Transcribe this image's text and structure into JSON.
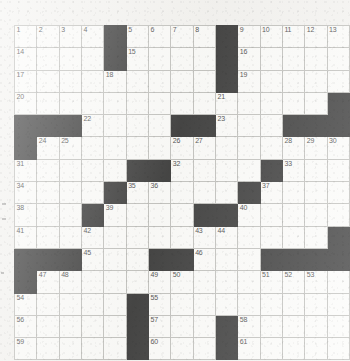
{
  "puzzle": {
    "title": "Crossword Grid",
    "rows": 15,
    "cols": 15,
    "cell_size_px": 21.5,
    "colors": {
      "paper": "#f2f1ee",
      "cell_fill": "#fbfbf9",
      "block_fill": "#0d0d0d",
      "grid_line": "#b3b3af",
      "number_text": "#1a1a1a"
    },
    "highest_clue_number": 61,
    "black_square_count": 54,
    "grid": [
      [
        {
          "block": false,
          "num": "1"
        },
        {
          "block": false,
          "num": "2"
        },
        {
          "block": false,
          "num": "3"
        },
        {
          "block": false,
          "num": "4"
        },
        {
          "block": true,
          "num": ""
        },
        {
          "block": false,
          "num": "5"
        },
        {
          "block": false,
          "num": "6"
        },
        {
          "block": false,
          "num": "7"
        },
        {
          "block": false,
          "num": "8"
        },
        {
          "block": true,
          "num": ""
        },
        {
          "block": false,
          "num": "9"
        },
        {
          "block": false,
          "num": "10"
        },
        {
          "block": false,
          "num": "11"
        },
        {
          "block": false,
          "num": "12"
        },
        {
          "block": false,
          "num": "13"
        }
      ],
      [
        {
          "block": false,
          "num": "14"
        },
        {
          "block": false,
          "num": ""
        },
        {
          "block": false,
          "num": ""
        },
        {
          "block": false,
          "num": ""
        },
        {
          "block": true,
          "num": ""
        },
        {
          "block": false,
          "num": "15"
        },
        {
          "block": false,
          "num": ""
        },
        {
          "block": false,
          "num": ""
        },
        {
          "block": false,
          "num": ""
        },
        {
          "block": true,
          "num": ""
        },
        {
          "block": false,
          "num": "16"
        },
        {
          "block": false,
          "num": ""
        },
        {
          "block": false,
          "num": ""
        },
        {
          "block": false,
          "num": ""
        },
        {
          "block": false,
          "num": ""
        }
      ],
      [
        {
          "block": false,
          "num": "17"
        },
        {
          "block": false,
          "num": ""
        },
        {
          "block": false,
          "num": ""
        },
        {
          "block": false,
          "num": ""
        },
        {
          "block": false,
          "num": "18"
        },
        {
          "block": false,
          "num": ""
        },
        {
          "block": false,
          "num": ""
        },
        {
          "block": false,
          "num": ""
        },
        {
          "block": false,
          "num": ""
        },
        {
          "block": true,
          "num": ""
        },
        {
          "block": false,
          "num": "19"
        },
        {
          "block": false,
          "num": ""
        },
        {
          "block": false,
          "num": ""
        },
        {
          "block": false,
          "num": ""
        },
        {
          "block": false,
          "num": ""
        }
      ],
      [
        {
          "block": false,
          "num": "20"
        },
        {
          "block": false,
          "num": ""
        },
        {
          "block": false,
          "num": ""
        },
        {
          "block": false,
          "num": ""
        },
        {
          "block": false,
          "num": ""
        },
        {
          "block": false,
          "num": ""
        },
        {
          "block": false,
          "num": ""
        },
        {
          "block": false,
          "num": ""
        },
        {
          "block": false,
          "num": ""
        },
        {
          "block": false,
          "num": "21"
        },
        {
          "block": false,
          "num": ""
        },
        {
          "block": false,
          "num": ""
        },
        {
          "block": false,
          "num": ""
        },
        {
          "block": false,
          "num": ""
        },
        {
          "block": true,
          "num": ""
        }
      ],
      [
        {
          "block": true,
          "num": ""
        },
        {
          "block": true,
          "num": ""
        },
        {
          "block": true,
          "num": ""
        },
        {
          "block": false,
          "num": "22"
        },
        {
          "block": false,
          "num": ""
        },
        {
          "block": false,
          "num": ""
        },
        {
          "block": false,
          "num": ""
        },
        {
          "block": true,
          "num": ""
        },
        {
          "block": true,
          "num": ""
        },
        {
          "block": false,
          "num": "23"
        },
        {
          "block": false,
          "num": ""
        },
        {
          "block": false,
          "num": ""
        },
        {
          "block": true,
          "num": ""
        },
        {
          "block": true,
          "num": ""
        },
        {
          "block": true,
          "num": ""
        }
      ],
      [
        {
          "block": true,
          "num": ""
        },
        {
          "block": false,
          "num": "24"
        },
        {
          "block": false,
          "num": "25"
        },
        {
          "block": false,
          "num": ""
        },
        {
          "block": false,
          "num": ""
        },
        {
          "block": false,
          "num": ""
        },
        {
          "block": false,
          "num": ""
        },
        {
          "block": false,
          "num": "26"
        },
        {
          "block": false,
          "num": "27"
        },
        {
          "block": false,
          "num": ""
        },
        {
          "block": false,
          "num": ""
        },
        {
          "block": false,
          "num": ""
        },
        {
          "block": false,
          "num": "28"
        },
        {
          "block": false,
          "num": "29"
        },
        {
          "block": false,
          "num": "30"
        }
      ],
      [
        {
          "block": false,
          "num": "31"
        },
        {
          "block": false,
          "num": ""
        },
        {
          "block": false,
          "num": ""
        },
        {
          "block": false,
          "num": ""
        },
        {
          "block": false,
          "num": ""
        },
        {
          "block": true,
          "num": ""
        },
        {
          "block": true,
          "num": ""
        },
        {
          "block": false,
          "num": "32"
        },
        {
          "block": false,
          "num": ""
        },
        {
          "block": false,
          "num": ""
        },
        {
          "block": false,
          "num": ""
        },
        {
          "block": true,
          "num": ""
        },
        {
          "block": false,
          "num": "33"
        },
        {
          "block": false,
          "num": ""
        },
        {
          "block": false,
          "num": ""
        }
      ],
      [
        {
          "block": false,
          "num": "34"
        },
        {
          "block": false,
          "num": ""
        },
        {
          "block": false,
          "num": ""
        },
        {
          "block": false,
          "num": ""
        },
        {
          "block": true,
          "num": ""
        },
        {
          "block": false,
          "num": "35"
        },
        {
          "block": false,
          "num": "36"
        },
        {
          "block": false,
          "num": ""
        },
        {
          "block": false,
          "num": ""
        },
        {
          "block": false,
          "num": ""
        },
        {
          "block": true,
          "num": ""
        },
        {
          "block": false,
          "num": "37"
        },
        {
          "block": false,
          "num": ""
        },
        {
          "block": false,
          "num": ""
        },
        {
          "block": false,
          "num": ""
        }
      ],
      [
        {
          "block": false,
          "num": "38"
        },
        {
          "block": false,
          "num": ""
        },
        {
          "block": false,
          "num": ""
        },
        {
          "block": true,
          "num": ""
        },
        {
          "block": false,
          "num": "39"
        },
        {
          "block": false,
          "num": ""
        },
        {
          "block": false,
          "num": ""
        },
        {
          "block": false,
          "num": ""
        },
        {
          "block": true,
          "num": ""
        },
        {
          "block": true,
          "num": ""
        },
        {
          "block": false,
          "num": "40"
        },
        {
          "block": false,
          "num": ""
        },
        {
          "block": false,
          "num": ""
        },
        {
          "block": false,
          "num": ""
        },
        {
          "block": false,
          "num": ""
        }
      ],
      [
        {
          "block": false,
          "num": "41"
        },
        {
          "block": false,
          "num": ""
        },
        {
          "block": false,
          "num": ""
        },
        {
          "block": false,
          "num": "42"
        },
        {
          "block": false,
          "num": ""
        },
        {
          "block": false,
          "num": ""
        },
        {
          "block": false,
          "num": ""
        },
        {
          "block": false,
          "num": ""
        },
        {
          "block": false,
          "num": "43"
        },
        {
          "block": false,
          "num": "44"
        },
        {
          "block": false,
          "num": ""
        },
        {
          "block": false,
          "num": ""
        },
        {
          "block": false,
          "num": ""
        },
        {
          "block": false,
          "num": ""
        },
        {
          "block": true,
          "num": ""
        }
      ],
      [
        {
          "block": true,
          "num": ""
        },
        {
          "block": true,
          "num": ""
        },
        {
          "block": true,
          "num": ""
        },
        {
          "block": false,
          "num": "45"
        },
        {
          "block": false,
          "num": ""
        },
        {
          "block": false,
          "num": ""
        },
        {
          "block": true,
          "num": ""
        },
        {
          "block": true,
          "num": ""
        },
        {
          "block": false,
          "num": "46"
        },
        {
          "block": false,
          "num": ""
        },
        {
          "block": false,
          "num": ""
        },
        {
          "block": true,
          "num": ""
        },
        {
          "block": true,
          "num": ""
        },
        {
          "block": true,
          "num": ""
        },
        {
          "block": true,
          "num": ""
        }
      ],
      [
        {
          "block": true,
          "num": ""
        },
        {
          "block": false,
          "num": "47"
        },
        {
          "block": false,
          "num": "48"
        },
        {
          "block": false,
          "num": ""
        },
        {
          "block": false,
          "num": ""
        },
        {
          "block": false,
          "num": ""
        },
        {
          "block": false,
          "num": "49"
        },
        {
          "block": false,
          "num": "50"
        },
        {
          "block": false,
          "num": ""
        },
        {
          "block": false,
          "num": ""
        },
        {
          "block": false,
          "num": ""
        },
        {
          "block": false,
          "num": "51"
        },
        {
          "block": false,
          "num": "52"
        },
        {
          "block": false,
          "num": "53"
        },
        {
          "block": false,
          "num": ""
        }
      ],
      [
        {
          "block": false,
          "num": "54"
        },
        {
          "block": false,
          "num": ""
        },
        {
          "block": false,
          "num": ""
        },
        {
          "block": false,
          "num": ""
        },
        {
          "block": false,
          "num": ""
        },
        {
          "block": true,
          "num": ""
        },
        {
          "block": false,
          "num": "55"
        },
        {
          "block": false,
          "num": ""
        },
        {
          "block": false,
          "num": ""
        },
        {
          "block": false,
          "num": ""
        },
        {
          "block": false,
          "num": ""
        },
        {
          "block": false,
          "num": ""
        },
        {
          "block": false,
          "num": ""
        },
        {
          "block": false,
          "num": ""
        },
        {
          "block": false,
          "num": ""
        }
      ],
      [
        {
          "block": false,
          "num": "56"
        },
        {
          "block": false,
          "num": ""
        },
        {
          "block": false,
          "num": ""
        },
        {
          "block": false,
          "num": ""
        },
        {
          "block": false,
          "num": ""
        },
        {
          "block": true,
          "num": ""
        },
        {
          "block": false,
          "num": "57"
        },
        {
          "block": false,
          "num": ""
        },
        {
          "block": false,
          "num": ""
        },
        {
          "block": true,
          "num": ""
        },
        {
          "block": false,
          "num": "58"
        },
        {
          "block": false,
          "num": ""
        },
        {
          "block": false,
          "num": ""
        },
        {
          "block": false,
          "num": ""
        },
        {
          "block": false,
          "num": ""
        }
      ],
      [
        {
          "block": false,
          "num": "59"
        },
        {
          "block": false,
          "num": ""
        },
        {
          "block": false,
          "num": ""
        },
        {
          "block": false,
          "num": ""
        },
        {
          "block": false,
          "num": ""
        },
        {
          "block": true,
          "num": ""
        },
        {
          "block": false,
          "num": "60"
        },
        {
          "block": false,
          "num": ""
        },
        {
          "block": false,
          "num": ""
        },
        {
          "block": true,
          "num": ""
        },
        {
          "block": false,
          "num": "61"
        },
        {
          "block": false,
          "num": ""
        },
        {
          "block": false,
          "num": ""
        },
        {
          "block": false,
          "num": ""
        },
        {
          "block": false,
          "num": ""
        }
      ]
    ]
  }
}
